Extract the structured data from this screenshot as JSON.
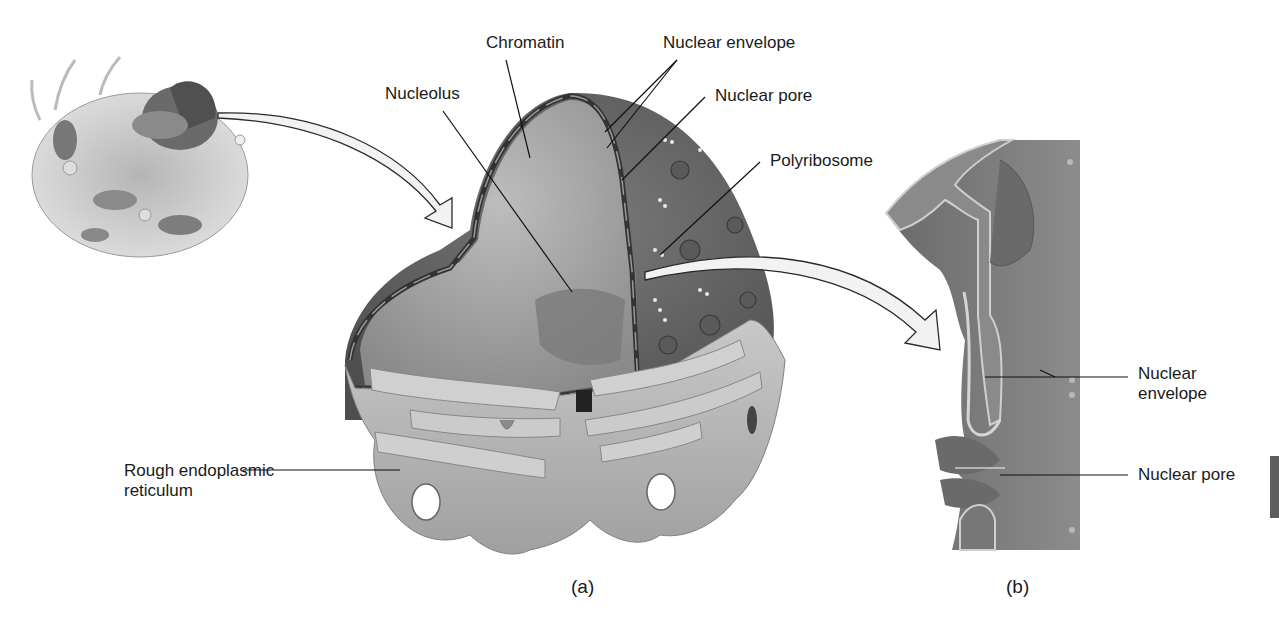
{
  "figure": {
    "panels": [
      {
        "id": "a",
        "caption": "(a)"
      },
      {
        "id": "b",
        "caption": "(b)"
      }
    ]
  },
  "labels": {
    "chromatin": "Chromatin",
    "nuclear_envelope_a": "Nuclear envelope",
    "nucleolus": "Nucleolus",
    "nuclear_pore_a": "Nuclear pore",
    "polyribosome": "Polyribosome",
    "rough_er_line1": "Rough endoplasmic",
    "rough_er_line2": "reticulum",
    "nuclear_envelope_b_line1": "Nuclear",
    "nuclear_envelope_b_line2": "envelope",
    "nuclear_pore_b": "Nuclear pore"
  },
  "colors": {
    "background": "#ffffff",
    "nucleus_outer": "#6e6e6e",
    "nucleus_inner": "#a9a9a9",
    "er": "#b4b4b4",
    "envelope_dark": "#3c3c3c",
    "arrow_fill": "#f2f2f2",
    "text": "#1a1a1a"
  }
}
